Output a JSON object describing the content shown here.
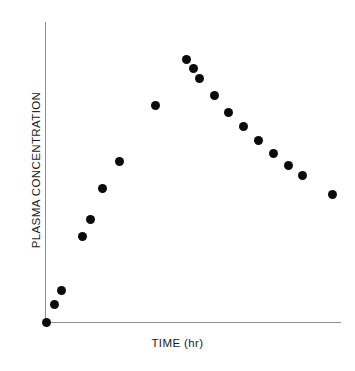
{
  "chart_data": {
    "type": "scatter",
    "title": "",
    "xlabel": "TIME (hr)",
    "ylabel": "PLASMA CONCENTRATION",
    "grid": false,
    "legend": null,
    "axes": {
      "x_ticks": [],
      "y_ticks": [],
      "x_tick_labels": [],
      "y_tick_labels": [],
      "xlim": [
        0,
        100
      ],
      "ylim": [
        0,
        100
      ],
      "origin_px": [
        46,
        322
      ],
      "x_axis_end_px": [
        341,
        322
      ],
      "y_axis_top_px": [
        46,
        22
      ]
    },
    "marker": {
      "shape": "circle",
      "color": "#0b0b0b",
      "diameter_px": 9
    },
    "series": [
      {
        "name": "plasma concentration",
        "n_points": 19,
        "points_px": [
          [
            46,
            322
          ],
          [
            54,
            304
          ],
          [
            61,
            290
          ],
          [
            82,
            236
          ],
          [
            90,
            219
          ],
          [
            102,
            188
          ],
          [
            119,
            161
          ],
          [
            155,
            105
          ],
          [
            186,
            59
          ],
          [
            193,
            68
          ],
          [
            199,
            78
          ],
          [
            214,
            95
          ],
          [
            228,
            112
          ],
          [
            243,
            126
          ],
          [
            258,
            140
          ],
          [
            273,
            153
          ],
          [
            288,
            165
          ],
          [
            302,
            175
          ],
          [
            332,
            194
          ]
        ],
        "x": [
          0,
          2.7,
          5.1,
          12.2,
          15,
          19,
          24.7,
          36.9,
          47.5,
          49.8,
          51.9,
          57,
          61.7,
          66.8,
          71.9,
          76.9,
          82,
          86.8,
          96.9
        ],
        "y": [
          0,
          6,
          10.7,
          28.7,
          34.3,
          44.7,
          53.7,
          72.3,
          87.7,
          84.7,
          81.3,
          75.7,
          70,
          65.3,
          60.7,
          56.3,
          52.3,
          49,
          42.7
        ]
      }
    ]
  },
  "figure": {
    "x_axis_title": "TIME (hr)",
    "y_axis_title": "PLASMA CONCENTRATION"
  }
}
